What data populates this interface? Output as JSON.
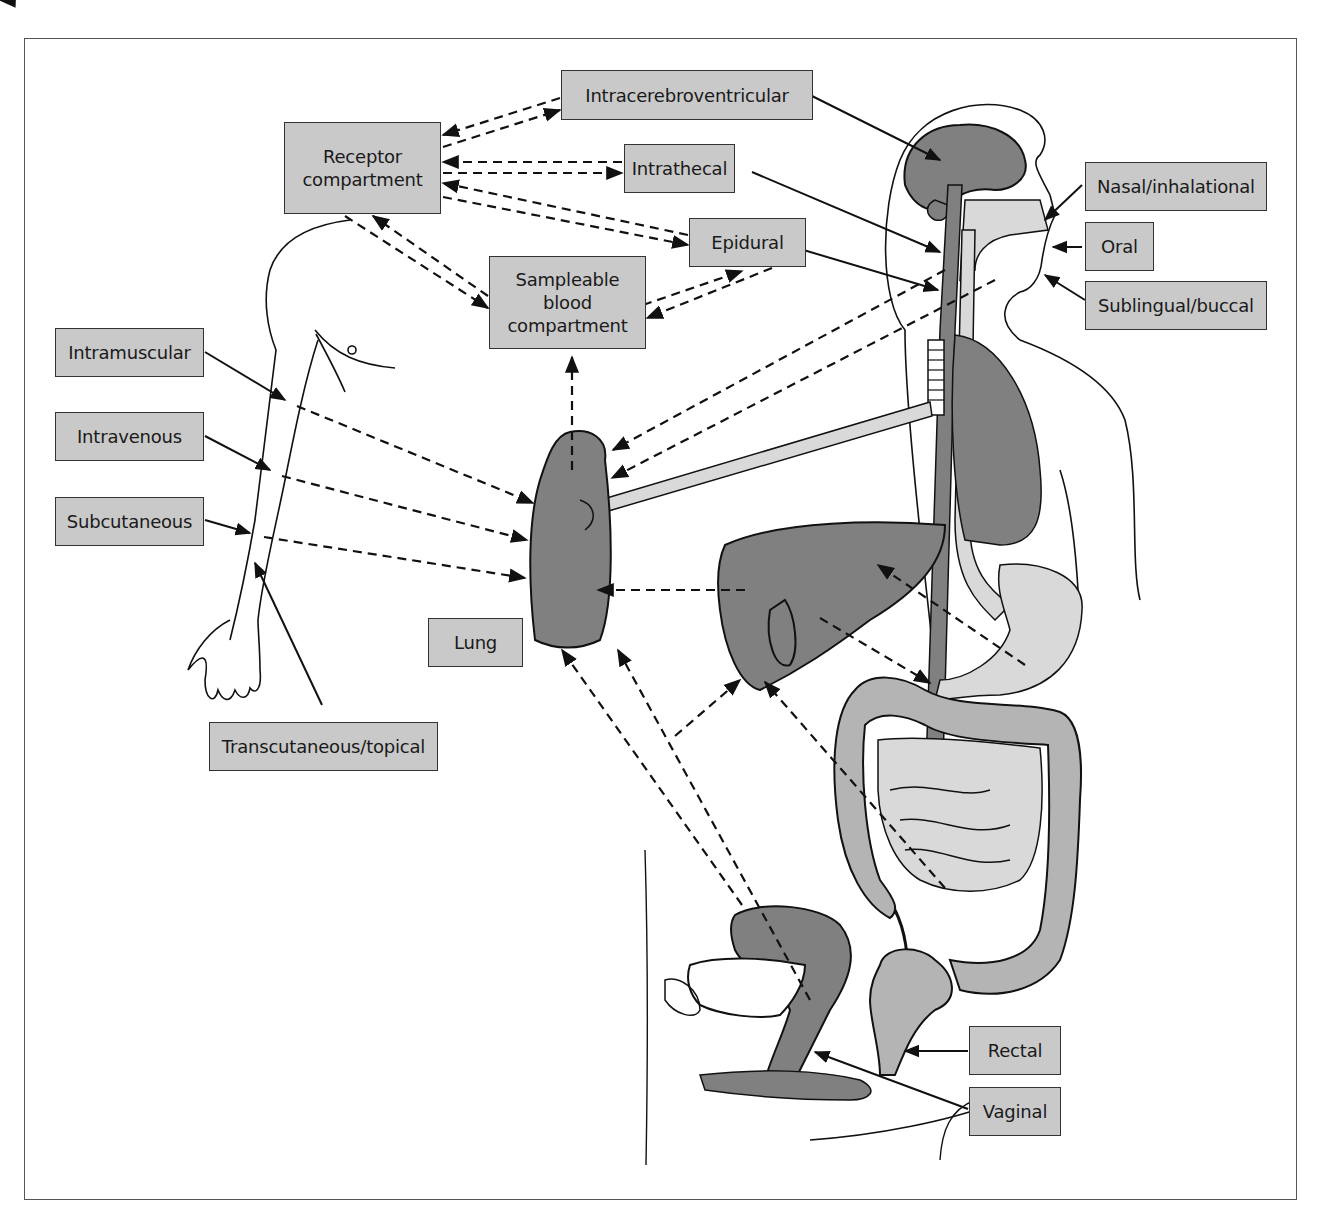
{
  "diagram": {
    "type": "drug-administration-routes-anatomy",
    "colors": {
      "label_fill": "#c9c9c9",
      "label_border": "#333333",
      "organ_dark": "#7f7f7f",
      "organ_light": "#d9d9d9",
      "line": "#111111"
    },
    "compartments": {
      "receptor": "Receptor\ncompartment",
      "blood": "Sampleable\nblood\ncompartment"
    },
    "routes": {
      "intracerebroventricular": "Intracerebroventricular",
      "intrathecal": "Intrathecal",
      "epidural": "Epidural",
      "nasal": "Nasal/inhalational",
      "oral": "Oral",
      "sublingual": "Sublingual/buccal",
      "intramuscular": "Intramuscular",
      "intravenous": "Intravenous",
      "subcutaneous": "Subcutaneous",
      "transcutaneous": "Transcutaneous/topical",
      "rectal": "Rectal",
      "vaginal": "Vaginal"
    },
    "organs": {
      "lung": "Lung"
    },
    "organ_icons": [
      "brain-icon",
      "spinal-cord-icon",
      "lung-icon",
      "liver-icon",
      "stomach-icon",
      "intestine-icon",
      "uterus-icon",
      "rectum-icon",
      "arm-icon",
      "hand-icon"
    ]
  }
}
